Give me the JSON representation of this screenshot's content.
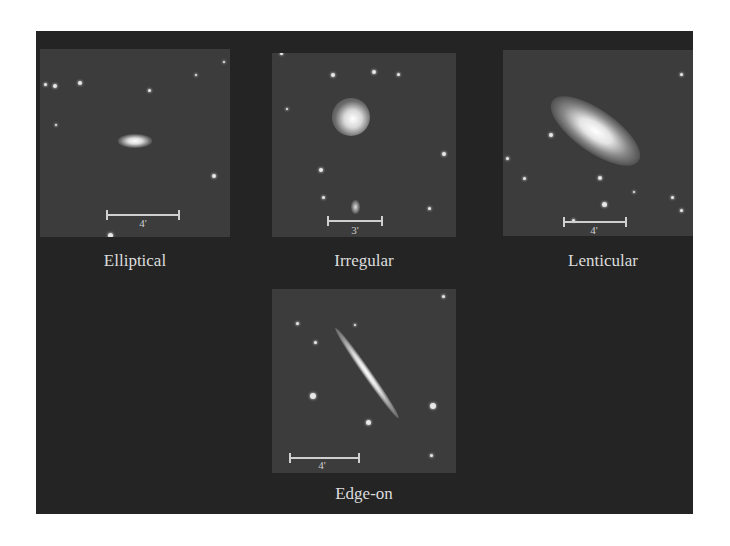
{
  "figure": {
    "panels": [
      {
        "id": "elliptical",
        "caption": "Elliptical",
        "scale_label": "4'"
      },
      {
        "id": "irregular",
        "caption": "Irregular",
        "scale_label": "3'"
      },
      {
        "id": "lenticular",
        "caption": "Lenticular",
        "scale_label": "4'"
      },
      {
        "id": "edge-on",
        "caption": "Edge-on",
        "scale_label": "4'"
      }
    ],
    "colors": {
      "panel_bg": "#242424",
      "image_bg": "#3c3c3c",
      "text": "#dcdcdc"
    }
  }
}
